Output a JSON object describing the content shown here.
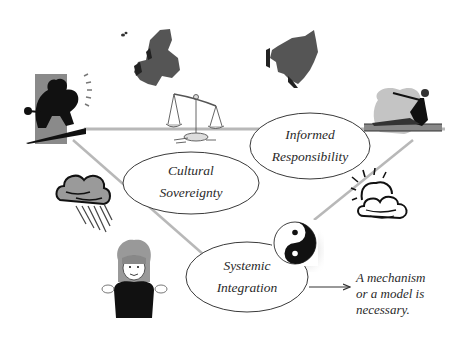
{
  "diagram": {
    "nodes": [
      {
        "id": "informed-responsibility",
        "lines": [
          "Informed",
          "Responsibility"
        ]
      },
      {
        "id": "cultural-sovereignty",
        "lines": [
          "Cultural",
          "Sovereignty"
        ]
      },
      {
        "id": "systemic-integration",
        "lines": [
          "Systemic",
          "Integration"
        ]
      }
    ],
    "note": {
      "lines": [
        "A mechanism",
        "or a model is",
        "necessary."
      ]
    },
    "edges": [
      {
        "from": "systemic-integration",
        "to": "note",
        "type": "arrow"
      }
    ],
    "clipart": [
      "surfer-figure-icon",
      "europe-map-icon",
      "asia-map-icon",
      "balance-scale-icon",
      "exercising-woman-icon",
      "rain-cloud-icon",
      "sun-cloud-icon",
      "girl-shrugging-icon",
      "yin-yang-icon"
    ],
    "colors": {
      "line_gray": "#b8b8b8",
      "ellipse_stroke": "#3a3a3a",
      "text": "#2a2a2a",
      "map_fill": "#5a5a5a"
    }
  }
}
